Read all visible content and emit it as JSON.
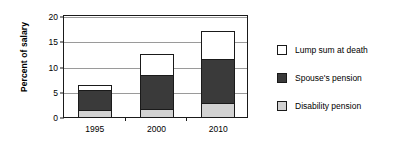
{
  "chart_data": {
    "type": "bar",
    "subtype": "stacked",
    "title": "",
    "xlabel": "",
    "ylabel": "Percent of salary",
    "categories": [
      "1995",
      "2000",
      "2010"
    ],
    "ylim": [
      0,
      20
    ],
    "yticks": [
      0,
      5,
      10,
      15,
      20
    ],
    "ytick_labels": [
      "0",
      "5",
      "10",
      "15",
      "20"
    ],
    "grid": true,
    "grid_axis": "y",
    "legend_position": "right",
    "series": [
      {
        "name": "Disability pension",
        "color": "#d2d2d2",
        "values": [
          1.3,
          1.5,
          2.8
        ]
      },
      {
        "name": "Spouse's pension",
        "color": "#3a3a3a",
        "values": [
          4.2,
          7.1,
          8.9
        ]
      },
      {
        "name": "Lump sum at death",
        "color": "#ffffff",
        "values": [
          1.2,
          4.2,
          5.8
        ]
      }
    ],
    "stack_totals": [
      6.7,
      12.8,
      17.5
    ],
    "legend_order": [
      "Lump sum at death",
      "Spouse's pension",
      "Disability pension"
    ]
  },
  "legend": {
    "items": [
      {
        "label": "Lump sum at death",
        "color": "#ffffff"
      },
      {
        "label": "Spouse's pension",
        "color": "#3a3a3a"
      },
      {
        "label": "Disability pension",
        "color": "#d2d2d2"
      }
    ]
  },
  "axes": {
    "y_title": "Percent of salary",
    "y_tick_labels": [
      "20",
      "15",
      "10",
      "5",
      "0"
    ],
    "x_tick_labels": [
      "1995",
      "2000",
      "2010"
    ]
  }
}
